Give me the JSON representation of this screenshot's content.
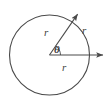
{
  "figure": {
    "background_color": "#ffffff",
    "stroke_color": "#4a4a4a",
    "label_color": "#3f3f3f",
    "width": 110,
    "height": 100,
    "labels": {
      "radius_upper": "r",
      "radius_right": "r",
      "radius_lower": "r",
      "angle": "θ"
    },
    "geometry": {
      "circle": {
        "cx": 49.5,
        "cy": 55,
        "r": 40
      },
      "center_point": {
        "x": 49.5,
        "y": 55
      },
      "horizontal_ray": {
        "x1": 49.5,
        "y1": 55,
        "x2": 105,
        "y2": 55
      },
      "diagonal_ray": {
        "x1": 49.5,
        "y1": 55,
        "x2": 79,
        "y2": 12
      },
      "angle_degrees": 55,
      "angle_arc_radius": 11
    }
  }
}
